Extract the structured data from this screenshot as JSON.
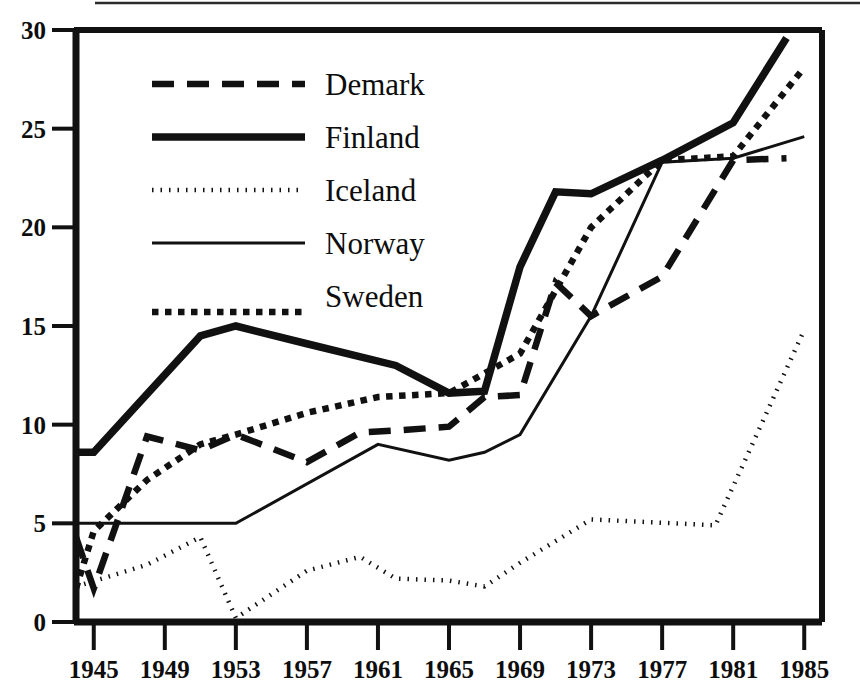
{
  "chart_data": {
    "type": "line",
    "title": "",
    "subtitle": "",
    "xlabel": "",
    "ylabel": "",
    "xlim": [
      1944,
      1986
    ],
    "ylim": [
      0,
      30
    ],
    "yticks": [
      0,
      5,
      10,
      15,
      20,
      25,
      30
    ],
    "ytick_labels": [
      "0",
      "5",
      "10",
      "15",
      "20",
      "25",
      "30"
    ],
    "xticks": [
      1945,
      1949,
      1953,
      1957,
      1961,
      1965,
      1969,
      1973,
      1977,
      1981,
      1985
    ],
    "xtick_labels": [
      "1945",
      "1949",
      "1953",
      "1957",
      "1961",
      "1965",
      "1969",
      "1973",
      "1977",
      "1981",
      "1985"
    ],
    "grid": false,
    "legend_position": "upper-left-inside",
    "series": [
      {
        "name": "Demark",
        "style": "dashed",
        "x": [
          1944,
          1945,
          1948,
          1951,
          1953,
          1957,
          1960,
          1962,
          1965,
          1967,
          1969,
          1971,
          1973,
          1977,
          1981,
          1984
        ],
        "values": [
          4.3,
          1.7,
          9.4,
          8.7,
          9.5,
          8.1,
          9.6,
          9.7,
          9.9,
          11.4,
          11.5,
          17.2,
          15.5,
          17.5,
          23.4,
          23.5
        ]
      },
      {
        "name": "Finland",
        "style": "thick-solid",
        "x": [
          1944,
          1945,
          1951,
          1953,
          1957,
          1962,
          1965,
          1967,
          1969,
          1971,
          1973,
          1977,
          1981,
          1984
        ],
        "values": [
          8.6,
          8.6,
          14.5,
          15.0,
          14.1,
          13.0,
          11.6,
          11.7,
          18.0,
          21.8,
          21.7,
          23.4,
          25.3,
          29.6
        ]
      },
      {
        "name": "Iceland",
        "style": "dotted",
        "x": [
          1944,
          1948,
          1951,
          1953,
          1957,
          1960,
          1962,
          1965,
          1967,
          1969,
          1973,
          1980,
          1985
        ],
        "values": [
          1.8,
          2.9,
          4.3,
          0.2,
          2.6,
          3.3,
          2.2,
          2.1,
          1.8,
          3.0,
          5.2,
          4.9,
          14.8
        ]
      },
      {
        "name": "Norway",
        "style": "thin-solid",
        "x": [
          1944,
          1945,
          1953,
          1961,
          1965,
          1967,
          1969,
          1973,
          1977,
          1981,
          1985
        ],
        "values": [
          5.0,
          5.0,
          5.0,
          9.0,
          8.2,
          8.6,
          9.5,
          15.5,
          23.3,
          23.5,
          24.6
        ]
      },
      {
        "name": "Sweden",
        "style": "dotted-thick",
        "x": [
          1944,
          1945,
          1948,
          1951,
          1953,
          1957,
          1961,
          1965,
          1967,
          1969,
          1973,
          1977,
          1981,
          1985
        ],
        "values": [
          1.7,
          4.6,
          7.2,
          9.0,
          9.5,
          10.6,
          11.4,
          11.6,
          12.6,
          13.6,
          20.0,
          23.4,
          23.6,
          28.1
        ]
      }
    ],
    "legend": [
      {
        "label": "Demark",
        "style": "dashed"
      },
      {
        "label": "Finland",
        "style": "thick-solid"
      },
      {
        "label": "Iceland",
        "style": "dotted"
      },
      {
        "label": "Norway",
        "style": "thin-solid"
      },
      {
        "label": "Sweden",
        "style": "dotted-thick"
      }
    ],
    "colors": {
      "line": "#111111",
      "axis": "#111111",
      "background": "#ffffff"
    }
  }
}
